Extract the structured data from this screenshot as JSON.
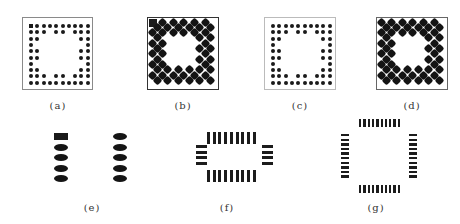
{
  "figure": {
    "panels": [
      {
        "id": "a",
        "label": "(a)",
        "type": "bga-small-dots",
        "grid": 10,
        "frame": {
          "x": 22,
          "y": 17,
          "w": 71,
          "h": 73
        }
      },
      {
        "id": "b",
        "label": "(b)",
        "type": "bga-large-diamonds",
        "grid": 10,
        "frame": {
          "x": 147,
          "y": 17,
          "w": 72,
          "h": 73
        }
      },
      {
        "id": "c",
        "label": "(c)",
        "type": "bga-small-dots",
        "grid": 10,
        "frame": {
          "x": 264,
          "y": 17,
          "w": 72,
          "h": 73
        }
      },
      {
        "id": "d",
        "label": "(d)",
        "type": "bga-large-diamonds",
        "grid": 10,
        "frame": {
          "x": 376,
          "y": 17,
          "w": 72,
          "h": 73
        }
      },
      {
        "id": "e",
        "label": "(e)",
        "type": "dual-column-oval-pads",
        "pads_per_column": 5
      },
      {
        "id": "f",
        "label": "(f)",
        "type": "qfp-pads",
        "pads_top": 9,
        "pads_bottom": 9,
        "pads_left": 4,
        "pads_right": 4
      },
      {
        "id": "g",
        "label": "(g)",
        "type": "qfp-pads",
        "pads_top": 10,
        "pads_bottom": 10,
        "pads_left": 10,
        "pads_right": 10
      }
    ],
    "labels": {
      "a": "(a)",
      "b": "(b)",
      "c": "(c)",
      "d": "(d)",
      "e": "(e)",
      "f": "(f)",
      "g": "(g)"
    },
    "colors": {
      "ink": "#1a1a1a",
      "frame": "#8a8a8a",
      "background": "#ffffff"
    }
  }
}
